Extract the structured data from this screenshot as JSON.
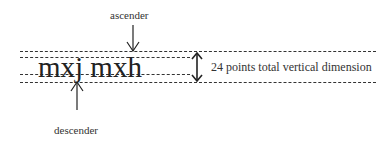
{
  "diagram": {
    "sample_text": "mxj mxh",
    "labels": {
      "ascender": "ascender",
      "descender": "descender",
      "dimension": "24 points total vertical dimension"
    },
    "lines": [
      {
        "name": "top-line",
        "y": 51
      },
      {
        "name": "ascender-line",
        "y": 57
      },
      {
        "name": "baseline",
        "y": 74
      },
      {
        "name": "bottom-line",
        "y": 82
      }
    ],
    "colors": {
      "line": "#333333",
      "text": "#222222"
    }
  }
}
